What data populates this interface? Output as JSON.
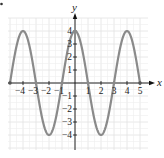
{
  "chart_data": {
    "type": "line",
    "title": "",
    "xlabel": "x",
    "ylabel": "y",
    "xlim": [
      -5,
      5
    ],
    "ylim": [
      -4,
      4
    ],
    "grid": true,
    "legend": null,
    "xticks": [
      -4,
      -3,
      -2,
      -1,
      1,
      2,
      3,
      4,
      5
    ],
    "xtick_labels": [
      "−4",
      "−3",
      "−2",
      "−1",
      "1",
      "2",
      "3",
      "4",
      "5"
    ],
    "yticks": [
      4,
      3,
      2,
      1,
      -1,
      -2,
      -3,
      -4
    ],
    "ytick_labels": [
      "4",
      "3",
      "2",
      "1",
      "−1",
      "−2",
      "−3",
      "−4"
    ],
    "series": [
      {
        "name": "y = 4cos(πx/2)",
        "color": "#8a8a8a",
        "x": [
          -5,
          -4.5,
          -4,
          -3.5,
          -3,
          -2.5,
          -2,
          -1.5,
          -1,
          -0.5,
          0,
          0.5,
          1,
          1.5,
          2,
          2.5,
          3,
          3.5,
          4,
          4.5,
          5
        ],
        "y": [
          0,
          2.83,
          4,
          2.83,
          0,
          -2.83,
          -4,
          -2.83,
          0,
          2.83,
          4,
          2.83,
          0,
          -2.83,
          -4,
          -2.83,
          0,
          2.83,
          4,
          2.83,
          0
        ]
      }
    ],
    "endpoints": [
      [
        -5,
        0
      ],
      [
        5,
        0
      ]
    ]
  },
  "style": {
    "axis_color": "#111111",
    "grid_color": "#e2e2e2",
    "curve_color": "#8a8a8a"
  }
}
